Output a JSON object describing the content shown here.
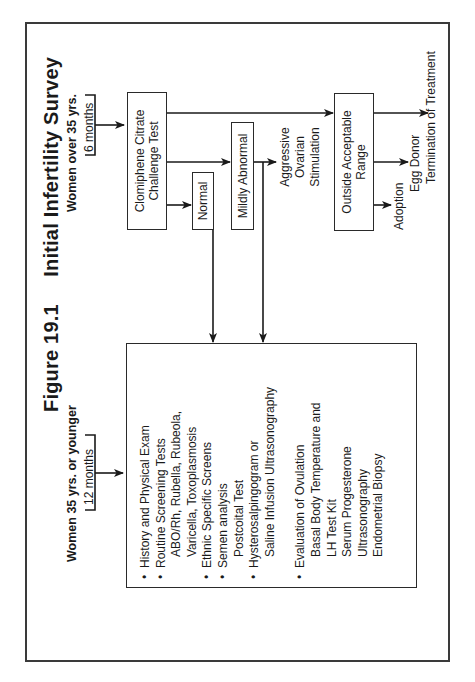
{
  "figure": {
    "number": "Figure 19.1",
    "title": "Initial Infertility Survey"
  },
  "groups": {
    "younger": {
      "label": "Women 35 yrs. or younger",
      "duration": "12 months"
    },
    "older": {
      "label": "Women over 35 yrs.",
      "duration": "6 months"
    }
  },
  "nodes": {
    "cct": {
      "line1": "Clomiphene Citrate",
      "line2": "Challenge Test"
    },
    "normal": {
      "label": "Normal"
    },
    "mildly_abnormal": {
      "label": "Mildly Abnormal"
    },
    "aggressive": {
      "line1": "Aggressive",
      "line2": "Ovarian",
      "line3": "Stimulation"
    },
    "outside_range": {
      "line1": "Outside Acceptable",
      "line2": "Range"
    },
    "outcomes": {
      "adoption": "Adoption",
      "egg_donor": "Egg Donor",
      "termination": "Termination of Treatment"
    }
  },
  "survey_list": {
    "items": [
      {
        "type": "bullet",
        "text": "History and Physical Exam"
      },
      {
        "type": "bullet",
        "text": "Routine Screening Tests"
      },
      {
        "type": "sub",
        "text": "ABO/Rh, Rubella, Rubeola,"
      },
      {
        "type": "sub2",
        "text": "Varicella, Toxoplasmosis"
      },
      {
        "type": "bullet",
        "text": "Ethnic Specific Screens"
      },
      {
        "type": "bullet",
        "text": "Semen analysis"
      },
      {
        "type": "sub",
        "text": "Postcoital Test"
      },
      {
        "type": "bullet",
        "text": "Hysterosalpingogram or"
      },
      {
        "type": "sub2",
        "text": "Saline Infusion Ultrasonography"
      },
      {
        "type": "gap",
        "text": ""
      },
      {
        "type": "bullet",
        "text": "Evaluation of Ovulation"
      },
      {
        "type": "sub",
        "text": "Basal Body Temperature and"
      },
      {
        "type": "sub2",
        "text": "LH Test Kit"
      },
      {
        "type": "sub2",
        "text": "Serum Progesterone"
      },
      {
        "type": "sub2",
        "text": "Ultrasonography"
      },
      {
        "type": "sub2",
        "text": "Endometrial Biopsy"
      }
    ],
    "bullet_glyph": "•"
  },
  "colors": {
    "ink": "#1a1a1a",
    "border": "#2a2a2a",
    "background": "#ffffff"
  }
}
